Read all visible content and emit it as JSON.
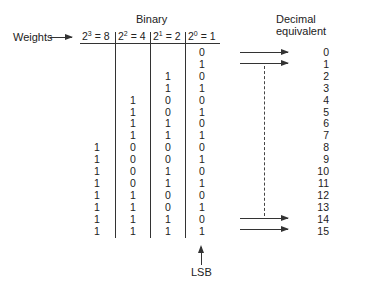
{
  "title_binary": "Binary",
  "title_decimal": "Decimal equivalent",
  "weights_label": "Weights",
  "headers": [
    {
      "base": "2",
      "exp": "3",
      "rest": " = 8"
    },
    {
      "base": "2",
      "exp": "2",
      "rest": " = 4"
    },
    {
      "base": "2",
      "exp": "1",
      "rest": " = 2"
    },
    {
      "base": "2",
      "exp": "0",
      "rest": " = 1"
    }
  ],
  "rows": [
    {
      "bits": [
        "",
        "",
        "",
        "0"
      ],
      "decimal": "0"
    },
    {
      "bits": [
        "",
        "",
        "",
        "1"
      ],
      "decimal": "1"
    },
    {
      "bits": [
        "",
        "",
        "1",
        "0"
      ],
      "decimal": "2"
    },
    {
      "bits": [
        "",
        "",
        "1",
        "1"
      ],
      "decimal": "3"
    },
    {
      "bits": [
        "",
        "1",
        "0",
        "0"
      ],
      "decimal": "4"
    },
    {
      "bits": [
        "",
        "1",
        "0",
        "1"
      ],
      "decimal": "5"
    },
    {
      "bits": [
        "",
        "1",
        "1",
        "0"
      ],
      "decimal": "6"
    },
    {
      "bits": [
        "",
        "1",
        "1",
        "1"
      ],
      "decimal": "7"
    },
    {
      "bits": [
        "1",
        "0",
        "0",
        "0"
      ],
      "decimal": "8"
    },
    {
      "bits": [
        "1",
        "0",
        "0",
        "1"
      ],
      "decimal": "9"
    },
    {
      "bits": [
        "1",
        "0",
        "1",
        "0"
      ],
      "decimal": "10"
    },
    {
      "bits": [
        "1",
        "0",
        "1",
        "1"
      ],
      "decimal": "11"
    },
    {
      "bits": [
        "1",
        "1",
        "0",
        "0"
      ],
      "decimal": "12"
    },
    {
      "bits": [
        "1",
        "1",
        "0",
        "1"
      ],
      "decimal": "13"
    },
    {
      "bits": [
        "1",
        "1",
        "1",
        "0"
      ],
      "decimal": "14"
    },
    {
      "bits": [
        "1",
        "1",
        "1",
        "1"
      ],
      "decimal": "15"
    }
  ],
  "lsb_label": "LSB"
}
